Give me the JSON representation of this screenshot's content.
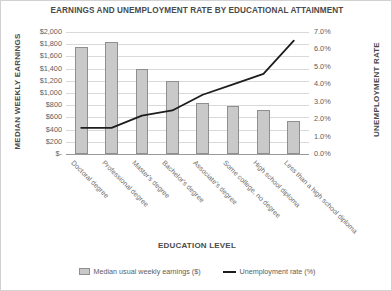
{
  "chart_data": {
    "type": "bar",
    "title": "EARNINGS AND UNEMPLOYMENT RATE BY EDUCATIONAL ATTAINMENT",
    "xlabel": "EDUCATION LEVEL",
    "ylabel": "MEDIAN WEEKLY EARNINGS",
    "y2label": "UNEMPLOYMENT RATE",
    "grid": true,
    "legend_position": "bottom",
    "categories": [
      "Doctoral degree",
      "Professional degree",
      "Master's degree",
      "Bachelor's degree",
      "Associate's degree",
      "Some college, no degree",
      "High school diploma",
      "Less than a high school diploma"
    ],
    "ylim": [
      0,
      2000
    ],
    "y2lim": [
      0,
      7
    ],
    "yticks": [
      "$-",
      "$200",
      "$400",
      "$600",
      "$800",
      "$1,000",
      "$1,200",
      "$1,400",
      "$1,600",
      "$1,800",
      "$2,000"
    ],
    "ytick_values": [
      0,
      200,
      400,
      600,
      800,
      1000,
      1200,
      1400,
      1600,
      1800,
      2000
    ],
    "y2ticks": [
      "0.0%",
      "1.0%",
      "2.0%",
      "3.0%",
      "4.0%",
      "5.0%",
      "6.0%",
      "7.0%"
    ],
    "y2tick_values": [
      0,
      1,
      2,
      3,
      4,
      5,
      6,
      7
    ],
    "series": [
      {
        "name": "Median usual weekly earnings ($)",
        "kind": "bar",
        "axis": "left",
        "color": "#c9c9c9",
        "border_color": "#8f8f8f",
        "values": [
          1750,
          1840,
          1400,
          1190,
          840,
          785,
          725,
          540
        ]
      },
      {
        "name": "Unemployment rate (%)",
        "kind": "line",
        "axis": "right",
        "color": "#1d1d1d",
        "values": [
          1.5,
          1.5,
          2.2,
          2.5,
          3.4,
          4.0,
          4.6,
          6.5
        ]
      }
    ]
  },
  "legend": {
    "earnings_label": "Median usual weekly earnings ($)",
    "unemployment_label": "Unemployment rate (%)"
  }
}
